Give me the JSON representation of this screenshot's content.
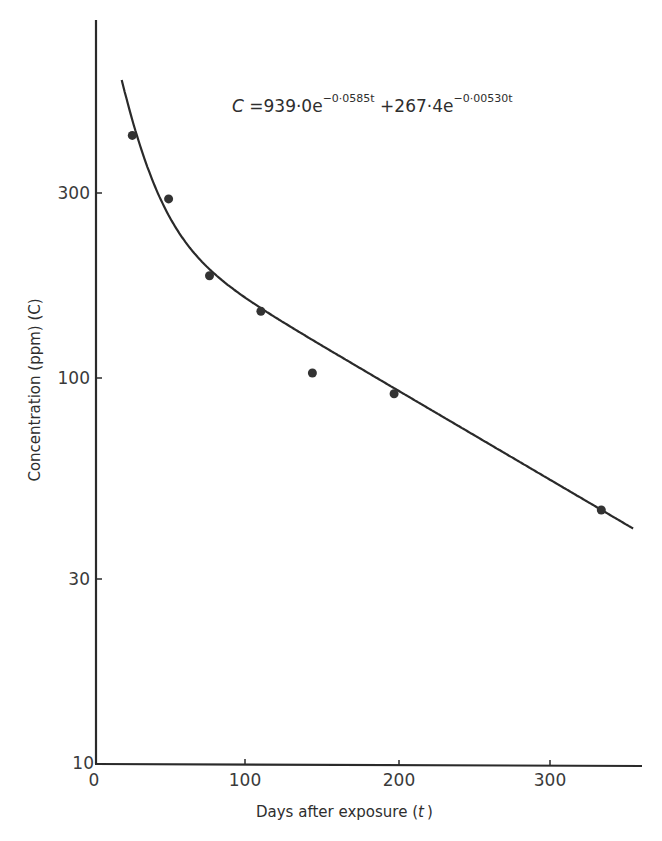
{
  "chart_data": {
    "type": "scatter",
    "title": "",
    "xlabel": "Days after exposure (t)",
    "ylabel": "Concentration (ppm) (C)",
    "xlim": [
      0,
      360
    ],
    "ylim": [
      10,
      800
    ],
    "yscale": "log",
    "grid": false,
    "legend": null,
    "x_ticks": [
      0,
      100,
      200,
      300
    ],
    "x_tick_labels": [
      "0",
      "100",
      "200",
      "300"
    ],
    "y_ticks": [
      10,
      30,
      100,
      300
    ],
    "y_tick_labels": [
      "10",
      "30",
      "100",
      "300"
    ],
    "series": [
      {
        "name": "Measured concentration",
        "kind": "points",
        "x": [
          24,
          48,
          75,
          109,
          143,
          197,
          334
        ],
        "y": [
          425,
          291,
          184,
          149,
          103,
          91,
          45.5
        ]
      },
      {
        "name": "Fitted bi-exponential curve",
        "kind": "line",
        "equation": "C = 939.0 e^(-0.0585 t) + 267.4 e^(-0.00530 t)",
        "A1": 939.0,
        "k1": 0.0585,
        "A2": 267.4,
        "k2": 0.0053,
        "t_start": 17,
        "t_end": 355
      }
    ],
    "annotations": [
      {
        "text": "C = 939·0e^(−0·0585t) + 267·4e^(−0·00530t)",
        "position": "upper-right"
      }
    ]
  },
  "labels": {
    "x_axis_title": "Days after exposure (",
    "x_axis_var": "t",
    "x_axis_close": ")",
    "y_axis_title": "Concentration (ppm) (C)",
    "eq_lhs": "C",
    "eq_eq": " =939·0e",
    "eq_exp1": "−0·0585t",
    "eq_plus": " +267·4e",
    "eq_exp2": "−0·00530t",
    "x_tick_0": "0",
    "x_tick_100": "100",
    "x_tick_200": "200",
    "x_tick_300": "300",
    "y_tick_10": "10",
    "y_tick_30": "30",
    "y_tick_100": "100",
    "y_tick_300": "300"
  },
  "colors": {
    "ink": "#2a2a2a",
    "background": "#ffffff"
  }
}
